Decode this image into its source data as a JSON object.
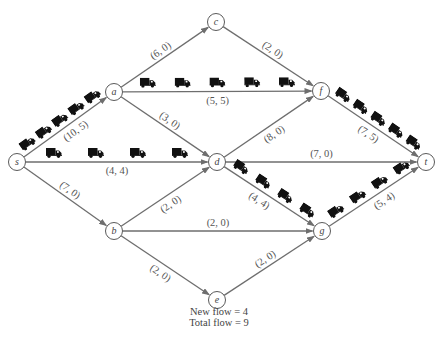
{
  "diagram": {
    "nodes": [
      {
        "id": "s",
        "label": "s"
      },
      {
        "id": "a",
        "label": "a"
      },
      {
        "id": "b",
        "label": "b"
      },
      {
        "id": "c",
        "label": "c"
      },
      {
        "id": "d",
        "label": "d"
      },
      {
        "id": "e",
        "label": "e"
      },
      {
        "id": "f",
        "label": "f"
      },
      {
        "id": "g",
        "label": "g"
      },
      {
        "id": "t",
        "label": "t"
      }
    ],
    "edges": [
      {
        "from": "s",
        "to": "a",
        "label": "(10, 5)",
        "capacity": 10,
        "flow": 5,
        "trucks": 5
      },
      {
        "from": "s",
        "to": "d",
        "label": "(4, 4)",
        "capacity": 4,
        "flow": 4,
        "trucks": 4
      },
      {
        "from": "s",
        "to": "b",
        "label": "(7, 0)",
        "capacity": 7,
        "flow": 0,
        "trucks": 0
      },
      {
        "from": "a",
        "to": "c",
        "label": "(6, 0)",
        "capacity": 6,
        "flow": 0,
        "trucks": 0
      },
      {
        "from": "a",
        "to": "f",
        "label": "(5, 5)",
        "capacity": 5,
        "flow": 5,
        "trucks": 5
      },
      {
        "from": "a",
        "to": "d",
        "label": "(3, 0)",
        "capacity": 3,
        "flow": 0,
        "trucks": 0
      },
      {
        "from": "c",
        "to": "f",
        "label": "(2, 0)",
        "capacity": 2,
        "flow": 0,
        "trucks": 0
      },
      {
        "from": "d",
        "to": "f",
        "label": "(8, 0)",
        "capacity": 8,
        "flow": 0,
        "trucks": 0
      },
      {
        "from": "d",
        "to": "t",
        "label": "(7, 0)",
        "capacity": 7,
        "flow": 0,
        "trucks": 0
      },
      {
        "from": "d",
        "to": "g",
        "label": "(4, 4)",
        "capacity": 4,
        "flow": 4,
        "trucks": 4
      },
      {
        "from": "b",
        "to": "d",
        "label": "(2, 0)",
        "capacity": 2,
        "flow": 0,
        "trucks": 0
      },
      {
        "from": "b",
        "to": "g",
        "label": "(2, 0)",
        "capacity": 2,
        "flow": 0,
        "trucks": 0
      },
      {
        "from": "b",
        "to": "e",
        "label": "(2, 0)",
        "capacity": 2,
        "flow": 0,
        "trucks": 0
      },
      {
        "from": "e",
        "to": "g",
        "label": "(2, 0)",
        "capacity": 2,
        "flow": 0,
        "trucks": 0
      },
      {
        "from": "f",
        "to": "t",
        "label": "(7, 5)",
        "capacity": 7,
        "flow": 5,
        "trucks": 5
      },
      {
        "from": "g",
        "to": "t",
        "label": "(5, 4)",
        "capacity": 5,
        "flow": 4,
        "trucks": 4
      }
    ],
    "icon": "truck-icon",
    "colors": {
      "edge": "#6e6e6e",
      "truck": "#111111",
      "node_stroke": "#5a5a5a"
    }
  },
  "footer": {
    "new_flow": "New flow  =  4",
    "total_flow": "Total flow  =  9"
  }
}
